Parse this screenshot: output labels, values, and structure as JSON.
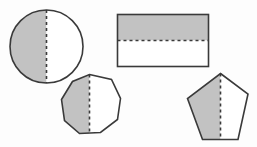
{
  "figure": {
    "canvas": {
      "width": 257,
      "height": 147
    },
    "colors": {
      "background": "#fdfdfd",
      "shaded_fill": "#c2c2c2",
      "unshaded_fill": "#ffffff",
      "outline": "#3a3a3a",
      "symmetry_line": "#3a3a3a"
    },
    "stroke": {
      "outline_width": 1.6,
      "dash_width": 1.6,
      "dash_pattern": "3,3"
    },
    "shapes": [
      {
        "name": "circle",
        "label": "Circle",
        "shape_type": "circle",
        "center": {
          "cx": 46.5,
          "cy": 46.5
        },
        "radius": 36.5,
        "symmetry_line": {
          "orientation": "vertical",
          "x1": 46.5,
          "y1": 10.0,
          "x2": 46.5,
          "y2": 83.0
        },
        "shaded_half": "left",
        "shaded_path": "M 46.5 10 A 36.5 36.5 0 0 0 46.5 83 Z",
        "unshaded_path": "M 46.5 10 A 36.5 36.5 0 0 1 46.5 83 Z"
      },
      {
        "name": "rectangle",
        "label": "Rectangle",
        "shape_type": "rectangle",
        "bounds": {
          "x": 117.5,
          "y": 14.5,
          "width": 91,
          "height": 52
        },
        "symmetry_line": {
          "orientation": "horizontal",
          "x1": 117.5,
          "y1": 40.5,
          "x2": 208.5,
          "y2": 40.5
        },
        "shaded_half": "top",
        "shaded_path": "M 117.5 14.5 L 208.5 14.5 L 208.5 40.5 L 117.5 40.5 Z",
        "unshaded_path": "M 117.5 40.5 L 208.5 40.5 L 208.5 66.5 L 117.5 66.5 Z"
      },
      {
        "name": "octagon",
        "label": "Octagon",
        "shape_type": "polygon",
        "sides": 8,
        "rotated": true,
        "outline_path": "M 89.5 74.5 L 111.5 79.5 L 120.5 98.5 L 117.5 119.5 L 100.5 132.5 L 79.5 133.5 L 64.5 120.5 L 61.5 99.5 L 72.5 81.5 Z",
        "symmetry_line": {
          "orientation": "vertical",
          "x1": 89.5,
          "y1": 74.5,
          "x2": 89.5,
          "y2": 133.5
        },
        "shaded_half": "left",
        "shaded_path": "M 89.5 74.5 L 89.5 133.5 L 79.5 133.5 L 64.5 120.5 L 61.5 99.5 L 72.5 81.5 Z",
        "unshaded_path": "M 89.5 74.5 L 111.5 79.5 L 120.5 98.5 L 117.5 119.5 L 100.5 132.5 L 89.5 133.5 Z"
      },
      {
        "name": "pentagon",
        "label": "Pentagon",
        "shape_type": "polygon",
        "sides": 5,
        "outline_path": "M 220.5 73.5 L 248.0 94.0 L 238.0 139.5 L 202.5 139.5 L 187.5 98.5 Z",
        "symmetry_line": {
          "orientation": "vertical",
          "x1": 220.5,
          "y1": 73.5,
          "x2": 220.5,
          "y2": 139.5
        },
        "shaded_half": "left",
        "shaded_path": "M 220.5 73.5 L 220.5 139.5 L 202.5 139.5 L 187.5 98.5 Z",
        "unshaded_path": "M 220.5 73.5 L 248.0 94.0 L 238.0 139.5 L 220.5 139.5 Z"
      }
    ]
  }
}
